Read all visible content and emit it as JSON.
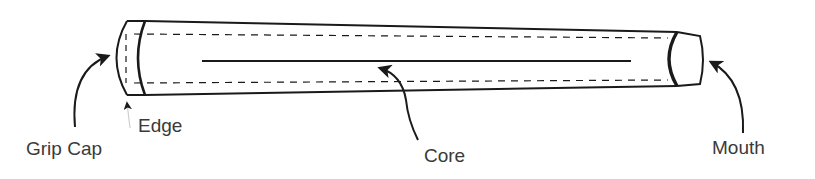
{
  "diagram": {
    "colors": {
      "stroke": "#1a1a1a",
      "label": "#3a3a3a",
      "background": "#ffffff"
    },
    "labels": {
      "grip_cap": "Grip Cap",
      "edge": "Edge",
      "core": "Core",
      "mouth": "Mouth"
    }
  }
}
